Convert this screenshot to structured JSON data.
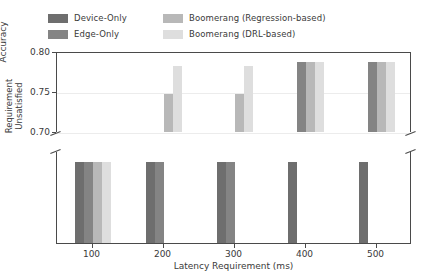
{
  "legend": {
    "entries": [
      {
        "label": "Device-Only",
        "color": "#6e6e6e"
      },
      {
        "label": "Edge-Only",
        "color": "#848484"
      },
      {
        "label": "Boomerang (Regression-based)",
        "color": "#b8b8b8"
      },
      {
        "label": "Boomerang (DRL-based)",
        "color": "#dedede"
      }
    ]
  },
  "chart_data": {
    "type": "bar",
    "title": "",
    "xlabel": "Latency Requirement (ms)",
    "ylabel_top": "Accuracy",
    "ylabel_bottom": "Requirement\nUnsatisfied",
    "categories": [
      "100",
      "200",
      "300",
      "400",
      "500"
    ],
    "top_panel": {
      "ylabel": "Accuracy",
      "ylim": [
        0.7,
        0.8
      ],
      "yticks": [
        0.7,
        0.75,
        0.8
      ],
      "ytick_labels": [
        "0.70",
        "0.75",
        "0.80"
      ],
      "grid": true,
      "note": "null means the method failed to meet the latency requirement; it is drawn in the lower Requirement-Unsatisfied panel instead",
      "series": [
        {
          "name": "Device-Only",
          "color": "#6e6e6e",
          "values": [
            null,
            null,
            null,
            null,
            null
          ]
        },
        {
          "name": "Edge-Only",
          "color": "#848484",
          "values": [
            null,
            null,
            null,
            0.787,
            0.787
          ]
        },
        {
          "name": "Boomerang (Regression-based)",
          "color": "#b8b8b8",
          "values": [
            null,
            0.748,
            0.747,
            0.787,
            0.787
          ]
        },
        {
          "name": "Boomerang (DRL-based)",
          "color": "#dedede",
          "values": [
            null,
            0.783,
            0.783,
            0.787,
            0.787
          ]
        }
      ]
    },
    "bottom_panel": {
      "ylabel": "Requirement Unsatisfied",
      "yticks": [],
      "grid": false,
      "note": "a bar of uniform height marks each method that violated the latency requirement",
      "series": [
        {
          "name": "Device-Only",
          "color": "#6e6e6e",
          "unsatisfied": [
            true,
            true,
            true,
            true,
            true
          ]
        },
        {
          "name": "Edge-Only",
          "color": "#848484",
          "unsatisfied": [
            true,
            true,
            true,
            false,
            false
          ]
        },
        {
          "name": "Boomerang (Regression-based)",
          "color": "#b8b8b8",
          "unsatisfied": [
            true,
            false,
            false,
            false,
            false
          ]
        },
        {
          "name": "Boomerang (DRL-based)",
          "color": "#dedede",
          "unsatisfied": [
            true,
            false,
            false,
            false,
            false
          ]
        }
      ]
    },
    "axis_break": true,
    "legend_position": "above-axes"
  }
}
